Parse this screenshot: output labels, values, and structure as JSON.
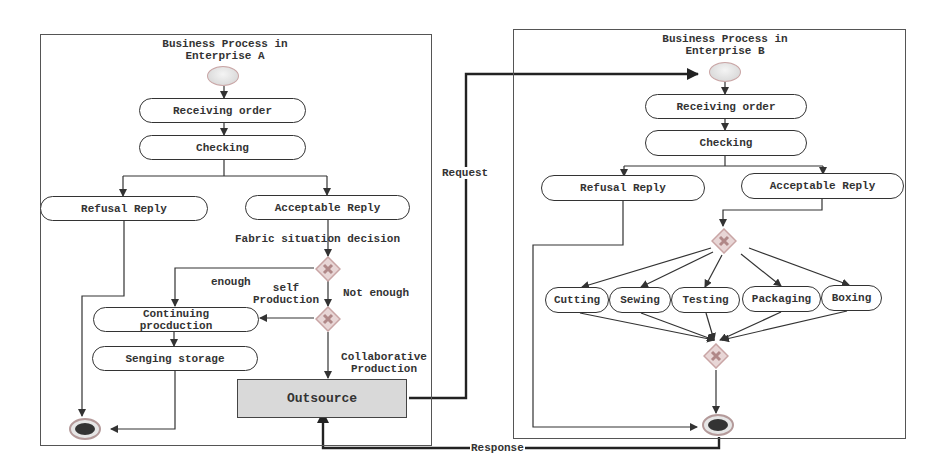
{
  "diagram": {
    "type": "business-process-activity-diagram",
    "enterprise_a": {
      "title_line1": "Business Process in",
      "title_line2": "Enterprise A",
      "nodes": {
        "receiving_order": "Receiving order",
        "checking": "Checking",
        "refusal_reply": "Refusal Reply",
        "acceptable_reply": "Acceptable Reply",
        "continuing_production_line1": "Continuing",
        "continuing_production_line2": "procduction",
        "sending_storage": "Senging storage",
        "outsource": "Outsource"
      },
      "labels": {
        "fabric_decision": "Fabric situation decision",
        "enough": "enough",
        "self_production_line1": "self",
        "self_production_line2": "Production",
        "not_enough": "Not enough",
        "collab_line1": "Collaborative",
        "collab_line2": "Production"
      }
    },
    "enterprise_b": {
      "title_line1": "Business Process in",
      "title_line2": "Enterprise B",
      "nodes": {
        "receiving_order": "Receiving order",
        "checking": "Checking",
        "refusal_reply": "Refusal Reply",
        "acceptable_reply": "Acceptable Reply",
        "parallel_tasks": [
          "Cutting",
          "Sewing",
          "Testing",
          "Packaging",
          "Boxing"
        ]
      }
    },
    "inter_enterprise": {
      "request_label": "Request",
      "response_label": "Response"
    },
    "colors": {
      "line": "#333333",
      "gateway_fill": "#e8d6d6",
      "gateway_border": "#c9a5a5",
      "outsource_fill": "#d9d9d9"
    }
  }
}
